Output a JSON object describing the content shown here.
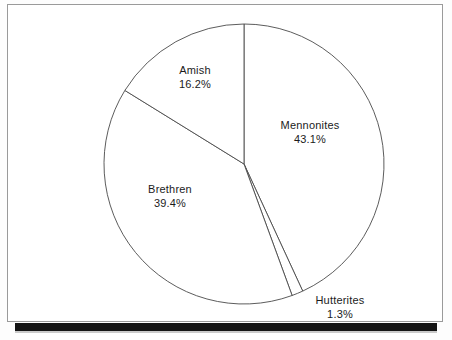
{
  "figure": {
    "frame_color": "#9a9a9a",
    "background_color": "#ffffff",
    "bottom_bar_color": "#141414"
  },
  "chart_data": {
    "type": "pie",
    "title": "",
    "subtitle": "",
    "xlabel": "",
    "ylabel": "",
    "grid": false,
    "legend_position": "none",
    "label_style": "name above value, centered, placed inside/beside slice",
    "start_angle_deg": 0,
    "direction": "clockwise",
    "units": "percent",
    "categories": [
      "Mennonites",
      "Hutterites",
      "Brethren",
      "Amish"
    ],
    "values": [
      43.1,
      1.3,
      39.4,
      16.2
    ],
    "slices": [
      {
        "label": "Mennonites",
        "value": 43.1,
        "value_text": "43.1%",
        "angle_deg": 155.2,
        "start_deg": 0.0,
        "end_deg": 155.2,
        "fill": "#ffffff",
        "stroke": "#4a4a4a"
      },
      {
        "label": "Hutterites",
        "value": 1.3,
        "value_text": "1.3%",
        "angle_deg": 4.7,
        "start_deg": 155.2,
        "end_deg": 159.9,
        "fill": "#ffffff",
        "stroke": "#4a4a4a"
      },
      {
        "label": "Brethren",
        "value": 39.4,
        "value_text": "39.4%",
        "angle_deg": 141.8,
        "start_deg": 159.9,
        "end_deg": 301.7,
        "fill": "#ffffff",
        "stroke": "#4a4a4a"
      },
      {
        "label": "Amish",
        "value": 16.2,
        "value_text": "16.2%",
        "angle_deg": 58.3,
        "start_deg": 301.7,
        "end_deg": 360.0,
        "fill": "#ffffff",
        "stroke": "#4a4a4a"
      }
    ],
    "geometry": {
      "center_x": 244,
      "center_y": 164,
      "radius": 140
    }
  }
}
